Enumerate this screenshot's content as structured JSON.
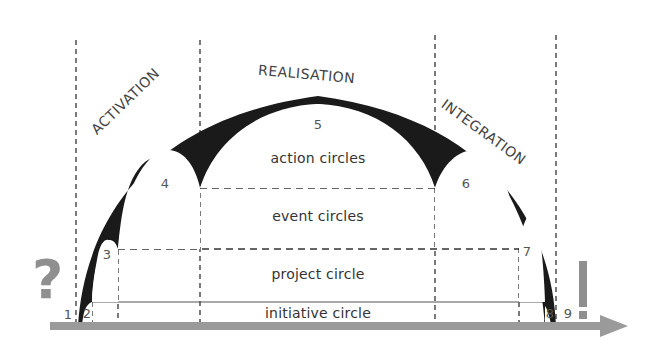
{
  "diagram": {
    "phases": {
      "activation": "ACTIVATION",
      "realisation": "REALISATION",
      "integration": "INTEGRATION"
    },
    "bands": {
      "action": "action circles",
      "event": "event circles",
      "project": "project circle",
      "initiative": "initiative circle"
    },
    "numbers": [
      "1",
      "2",
      "3",
      "4",
      "5",
      "6",
      "7",
      "8",
      "9"
    ],
    "symbols": {
      "start": "?",
      "end": "!"
    },
    "colors": {
      "arch_fill": "#1a1a1a",
      "axis": "#9a9a9a",
      "symbol": "#8f8f8f",
      "text": "#333333"
    }
  }
}
